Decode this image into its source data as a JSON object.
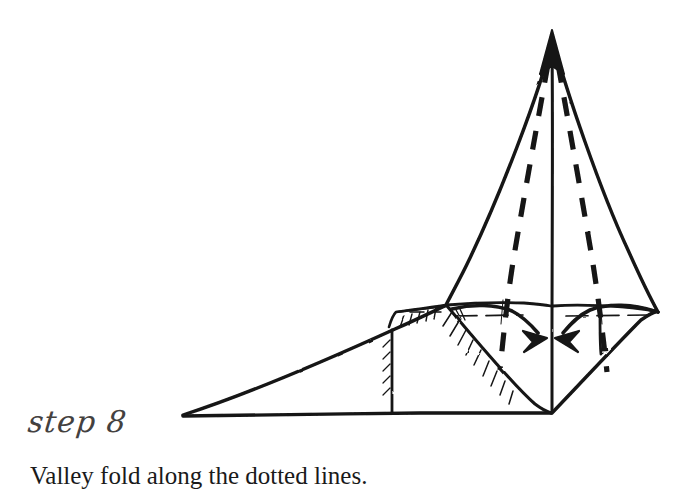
{
  "page": {
    "background_color": "#ffffff",
    "ink_color": "#141414",
    "step_label_color": "#44413f"
  },
  "instruction": {
    "step_label": "step 8",
    "step_number": 8,
    "caption": "Valley fold along the dotted lines."
  },
  "diagram": {
    "apex": {
      "x": 552,
      "y": 38
    },
    "bottom_vertex": {
      "x": 552,
      "y": 413
    },
    "left_tail_tip": {
      "x": 182,
      "y": 415
    },
    "right_corner": {
      "x": 658,
      "y": 312
    },
    "left_shoulder": {
      "x": 446,
      "y": 305
    },
    "fold_lines": [
      {
        "name": "left-dashed-fold",
        "from": {
          "x": 548,
          "y": 62
        },
        "to": {
          "x": 500,
          "y": 370
        }
      },
      {
        "name": "right-dashed-fold",
        "from": {
          "x": 558,
          "y": 62
        },
        "to": {
          "x": 607,
          "y": 372
        }
      }
    ],
    "arrows": [
      {
        "name": "left-fold-arrow",
        "direction": "right",
        "tip": {
          "x": 545,
          "y": 336
        }
      },
      {
        "name": "right-fold-arrow",
        "direction": "left",
        "tip": {
          "x": 560,
          "y": 336
        }
      }
    ],
    "center_line": {
      "from": {
        "x": 552,
        "y": 42
      },
      "to": {
        "x": 552,
        "y": 413
      }
    }
  }
}
